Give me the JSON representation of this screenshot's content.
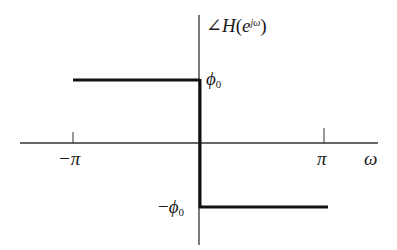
{
  "diagram": {
    "type": "phase-response-plot",
    "y_axis_label": {
      "angle_symbol": "∠",
      "func": "H",
      "open": "(",
      "base": "e",
      "exponent": "jω",
      "close": ")"
    },
    "x_axis_label": "ω",
    "x_ticks": [
      {
        "label": "−π",
        "value": "-pi"
      },
      {
        "label": "π",
        "value": "pi"
      }
    ],
    "levels": {
      "positive": {
        "symbol": "ϕ",
        "sub": "0",
        "prefix": ""
      },
      "negative": {
        "symbol": "ϕ",
        "sub": "0",
        "prefix": "−"
      }
    },
    "segments": [
      {
        "from": "-pi",
        "to": "0",
        "value": "phi_0"
      },
      {
        "from": "0",
        "to": "pi",
        "value": "-phi_0"
      }
    ],
    "colors": {
      "axis": "#333333",
      "curve": "#111111",
      "background": "#ffffff"
    }
  }
}
